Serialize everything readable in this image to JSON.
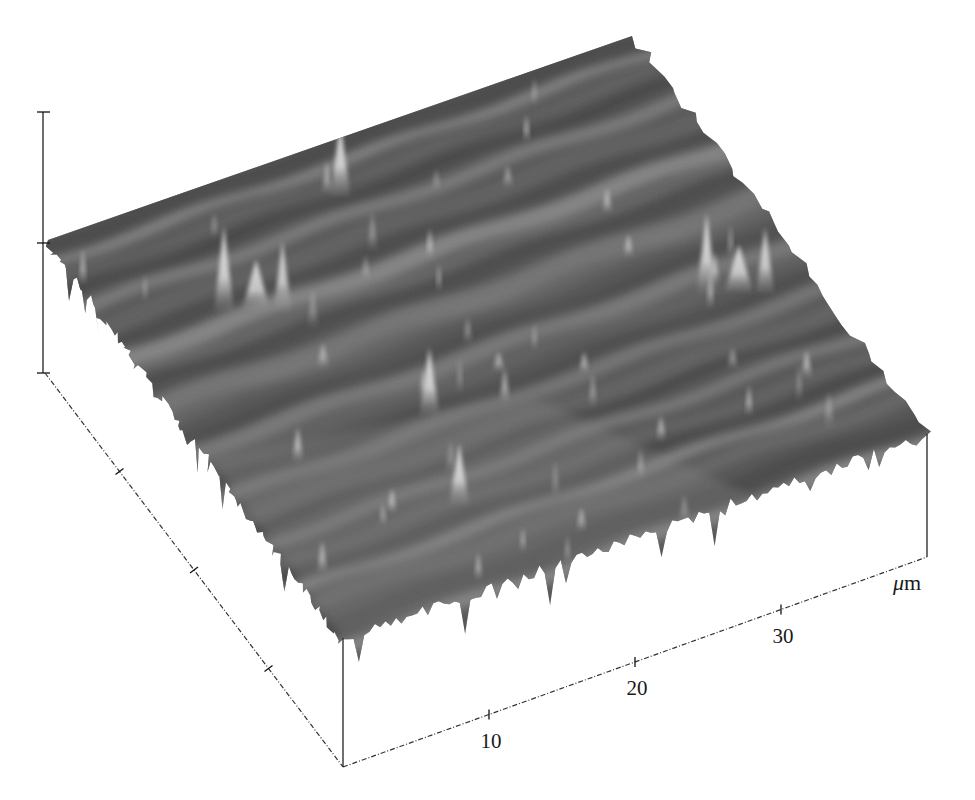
{
  "figure": {
    "colors": {
      "surface_dark": "#3c3c3c",
      "surface_mid": "#6e6e6e",
      "surface_light": "#9a9a9a",
      "peak_highlight": "#f2f2f2",
      "axis": "#222222",
      "background": "#ffffff"
    }
  },
  "chart_data": {
    "type": "heatmap",
    "subtype": "3d-surface",
    "title": "",
    "x_axis": {
      "label": "",
      "unit": "μm",
      "unit_mu": "μ",
      "unit_m": "m",
      "range": [
        0,
        40
      ],
      "ticks": [
        10,
        20,
        30
      ],
      "tick_labels": [
        "10",
        "20",
        "30"
      ]
    },
    "y_axis": {
      "label": "",
      "unit": "",
      "range": [
        0,
        40
      ],
      "ticks": [
        10,
        20,
        30
      ],
      "tick_labels": [
        "",
        "",
        ""
      ]
    },
    "z_axis": {
      "label": "",
      "unit": "",
      "ticks_fraction": [
        0,
        0.5,
        1
      ],
      "tick_labels": [
        "",
        "",
        ""
      ]
    },
    "colormap": "grayscale (higher = brighter)",
    "features": [
      {
        "name": "peak-cluster",
        "x_um": 7,
        "y_um": 30,
        "relative_height": 0.65
      },
      {
        "name": "tall-spike",
        "x_um": 18,
        "y_um": 36,
        "relative_height": 0.55
      },
      {
        "name": "peak-pair",
        "x_um": 34,
        "y_um": 18,
        "relative_height": 0.6
      },
      {
        "name": "spike",
        "x_um": 14,
        "y_um": 16,
        "relative_height": 0.5
      },
      {
        "name": "ridge-front",
        "x_um": 12,
        "y_um": 8,
        "relative_height": 0.45
      }
    ],
    "grid": false,
    "legend": "none"
  }
}
